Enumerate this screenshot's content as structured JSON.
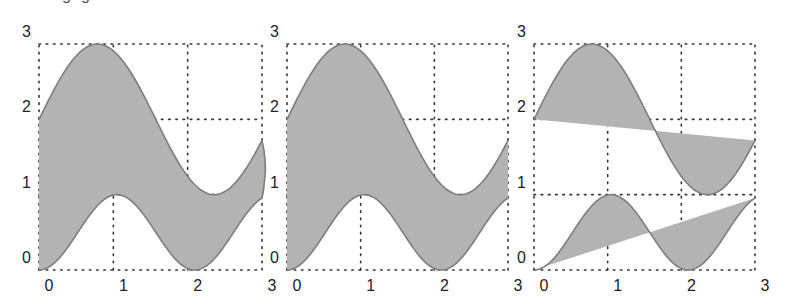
{
  "chart_data": [
    {
      "type": "area",
      "title": "",
      "fill_mode": "between-curves-smooth-closed",
      "xlabel": "",
      "ylabel": "",
      "xlim": [
        0,
        3
      ],
      "ylim": [
        0,
        3
      ],
      "grid": true,
      "xticks": [
        "0",
        "1",
        "2",
        "3"
      ],
      "yticks": [
        "0",
        "1",
        "2",
        "3"
      ],
      "series": [
        {
          "name": "upper",
          "formula": "2 + sin(2x)",
          "x": [
            0,
            0.25,
            0.5,
            0.75,
            1,
            1.25,
            1.5,
            1.75,
            2,
            2.25,
            2.5,
            2.75,
            3
          ],
          "y": [
            2.0,
            2.48,
            2.84,
            3.0,
            2.91,
            2.6,
            2.14,
            1.65,
            1.24,
            1.02,
            1.04,
            1.29,
            1.72
          ]
        },
        {
          "name": "lower",
          "formula": "sin^2(1.5x)",
          "x": [
            0,
            0.25,
            0.5,
            0.75,
            1,
            1.25,
            1.5,
            1.75,
            2,
            2.25,
            2.5,
            2.75,
            3
          ],
          "y": [
            0.0,
            0.13,
            0.47,
            0.81,
            0.99,
            0.91,
            0.61,
            0.25,
            0.02,
            0.05,
            0.35,
            0.72,
            0.96
          ]
        }
      ],
      "fill_color": "#b3b3b3",
      "line_color": "#7d7d7d"
    },
    {
      "type": "area",
      "title": "",
      "fill_mode": "between-curves-straight-closed",
      "xlabel": "",
      "ylabel": "",
      "xlim": [
        0,
        3
      ],
      "ylim": [
        0,
        3
      ],
      "grid": true,
      "xticks": [
        "0",
        "1",
        "2",
        "3"
      ],
      "yticks": [
        "0",
        "1",
        "2",
        "3"
      ],
      "series": [
        {
          "name": "upper",
          "formula": "2 + sin(2x)"
        },
        {
          "name": "lower",
          "formula": "sin^2(1.5x)"
        }
      ],
      "fill_color": "#b3b3b3",
      "line_color": "#7d7d7d"
    },
    {
      "type": "area",
      "title": "",
      "fill_mode": "each-curve-to-chord",
      "xlabel": "",
      "ylabel": "",
      "xlim": [
        0,
        3
      ],
      "ylim": [
        0,
        3
      ],
      "grid": true,
      "xticks": [
        "0",
        "1",
        "2",
        "3"
      ],
      "yticks": [
        "0",
        "1",
        "2",
        "3"
      ],
      "series": [
        {
          "name": "upper",
          "formula": "2 + sin(2x)"
        },
        {
          "name": "lower",
          "formula": "sin^2(1.5x)"
        }
      ],
      "fill_color": "#b3b3b3",
      "line_color": "#7d7d7d"
    }
  ],
  "caption_fragment": "gg"
}
